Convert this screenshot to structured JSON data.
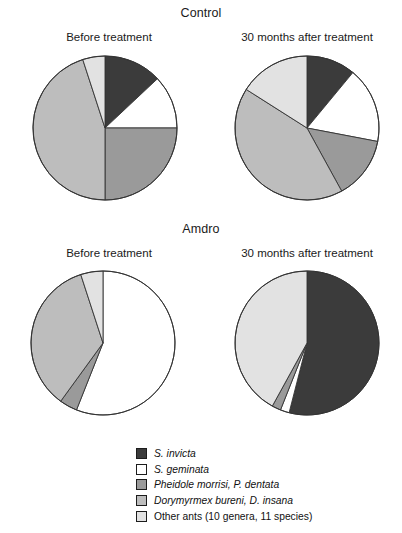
{
  "groups": [
    {
      "title": "Control"
    },
    {
      "title": "Amdro"
    }
  ],
  "panels": {
    "control_before": "Before treatment",
    "control_after": "30 months after treatment",
    "amdro_before": "Before treatment",
    "amdro_after": "30 months after treatment"
  },
  "colors": {
    "s_invicta": "#3b3b3b",
    "s_geminata": "#ffffff",
    "pheidole": "#9a9a9a",
    "dorymyrmex": "#bdbdbd",
    "other_ants": "#e2e2e2",
    "outline": "#333333"
  },
  "legend": {
    "items": [
      {
        "label": "S. invicta",
        "color": "#3b3b3b",
        "italic": true,
        "key": "s_invicta"
      },
      {
        "label": "S. geminata",
        "color": "#ffffff",
        "italic": true,
        "key": "s_geminata"
      },
      {
        "label": "Pheidole morrisi, P. dentata",
        "color": "#9a9a9a",
        "italic": true,
        "key": "pheidole"
      },
      {
        "label": "Dorymyrmex bureni, D. insana",
        "color": "#bdbdbd",
        "italic": true,
        "key": "dorymyrmex"
      },
      {
        "label": "Other ants (10 genera, 11 species)",
        "color": "#e2e2e2",
        "italic": false,
        "key": "other_ants"
      }
    ]
  },
  "chart_data": [
    {
      "type": "pie",
      "title": "Control — Before treatment",
      "group": "Control",
      "panel": "Before treatment",
      "categories": [
        "S. invicta",
        "S. geminata",
        "Pheidole morrisi, P. dentata",
        "Dorymyrmex bureni, D. insana",
        "Other ants (10 genera, 11 species)"
      ],
      "values": [
        13,
        12,
        25,
        45,
        5
      ],
      "unit": "percent",
      "start_angle_deg": 0,
      "direction": "clockwise"
    },
    {
      "type": "pie",
      "title": "Control — 30 months after treatment",
      "group": "Control",
      "panel": "30 months after treatment",
      "categories": [
        "S. invicta",
        "S. geminata",
        "Pheidole morrisi, P. dentata",
        "Dorymyrmex bureni, D. insana",
        "Other ants (10 genera, 11 species)"
      ],
      "values": [
        11,
        17,
        14,
        42,
        16
      ],
      "unit": "percent",
      "start_angle_deg": 0,
      "direction": "clockwise"
    },
    {
      "type": "pie",
      "title": "Amdro — Before treatment",
      "group": "Amdro",
      "panel": "Before treatment",
      "categories": [
        "S. invicta",
        "S. geminata",
        "Pheidole morrisi, P. dentata",
        "Dorymyrmex bureni, D. insana",
        "Other ants (10 genera, 11 species)"
      ],
      "values": [
        0,
        56,
        4,
        35,
        5
      ],
      "unit": "percent",
      "start_angle_deg": 0,
      "direction": "clockwise"
    },
    {
      "type": "pie",
      "title": "Amdro — 30 months after treatment",
      "group": "Amdro",
      "panel": "30 months after treatment",
      "categories": [
        "S. invicta",
        "S. geminata",
        "Pheidole morrisi, P. dentata",
        "Dorymyrmex bureni, D. insana",
        "Other ants (10 genera, 11 species)"
      ],
      "values": [
        54,
        2,
        2,
        0,
        42
      ],
      "unit": "percent",
      "start_angle_deg": 0,
      "direction": "clockwise"
    }
  ]
}
